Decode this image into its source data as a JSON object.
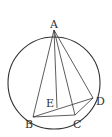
{
  "diagram": {
    "type": "geometry",
    "points": {
      "A": {
        "label": "A",
        "x": 54,
        "y": 30
      },
      "B": {
        "label": "B",
        "x": 33,
        "y": 117
      },
      "C": {
        "label": "C",
        "x": 75,
        "y": 115
      },
      "D": {
        "label": "D",
        "x": 93,
        "y": 98
      },
      "E": {
        "label": "E",
        "x": 57,
        "y": 109
      }
    },
    "circle": {
      "cx": 54,
      "cy": 83,
      "r": 46
    },
    "segments": [
      "AB",
      "AE",
      "AC",
      "AD",
      "BD",
      "BC",
      "CD"
    ],
    "colors": {
      "stroke": "#333333",
      "background": "#ffffff"
    }
  }
}
